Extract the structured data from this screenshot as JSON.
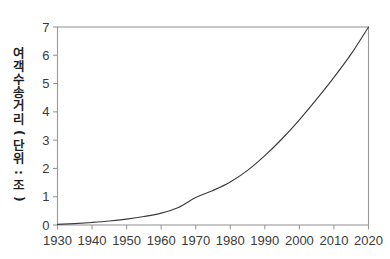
{
  "chart_data": {
    "type": "line",
    "title": "",
    "xlabel": "",
    "ylabel": "여객 수송 거리(단위: 조)",
    "xlim": [
      1930,
      2020
    ],
    "ylim": [
      0,
      7
    ],
    "grid": false,
    "legend": null,
    "x_ticks": [
      "1930",
      "1940",
      "1950",
      "1960",
      "1970",
      "1980",
      "1990",
      "2000",
      "2010",
      "2020"
    ],
    "y_ticks": [
      "0",
      "1",
      "2",
      "3",
      "4",
      "5",
      "6",
      "7"
    ],
    "series": [
      {
        "name": "여객 수송 거리",
        "color": "#3b3b3b",
        "x": [
          1930,
          1935,
          1940,
          1945,
          1950,
          1955,
          1960,
          1965,
          1970,
          1975,
          1980,
          1985,
          1990,
          1995,
          2000,
          2005,
          2010,
          2015,
          2020
        ],
        "values": [
          0.02,
          0.05,
          0.09,
          0.14,
          0.21,
          0.3,
          0.42,
          0.62,
          0.97,
          1.22,
          1.52,
          1.93,
          2.45,
          3.05,
          3.72,
          4.45,
          5.22,
          6.05,
          7.0
        ]
      }
    ]
  },
  "axis_label": {
    "y": "여객 수송 거리(단위: 조)"
  }
}
